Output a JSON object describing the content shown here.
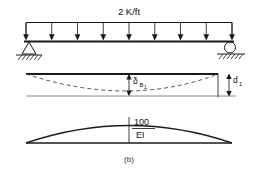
{
  "figure": {
    "caption": "(b)",
    "panels": {
      "load_panel": {
        "name": "uniformly-loaded-simple-beam",
        "load_label": "2 K/ft",
        "load_arrow_count": 9,
        "left_support": "pin-support",
        "right_support": "roller-support",
        "ground": "hatched-ground"
      },
      "deflection_panel": {
        "name": "deflected-shape-diagram",
        "center_dimension_label": "δ",
        "center_dimension_sub": "B",
        "center_dimension_subsub": "1",
        "end_dimension_label": "d",
        "end_dimension_sub": "1",
        "curve_style": "dashed"
      },
      "moment_panel": {
        "name": "m-over-ei-parabola",
        "numerator": "100",
        "denominator": "EI",
        "shape": "parabola"
      }
    },
    "colors": {
      "ink": "#1a1a1a",
      "grey": "#8a8a8a",
      "dashed": "#555555",
      "background": "#ffffff"
    }
  }
}
